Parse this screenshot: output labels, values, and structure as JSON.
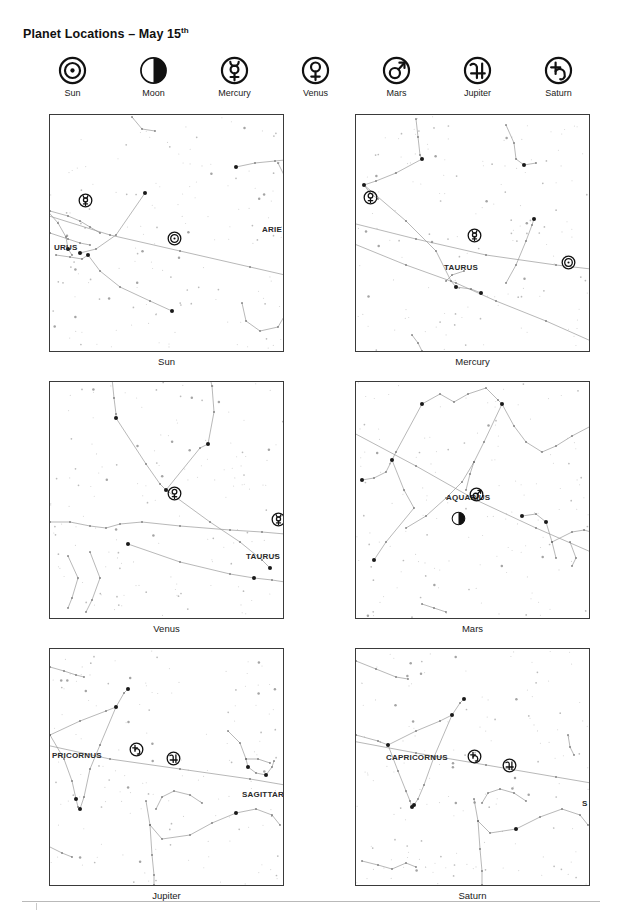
{
  "title": {
    "main": "Planet Locations – May 15",
    "ordinal": "th"
  },
  "legend": {
    "items": [
      {
        "label": "Sun",
        "icon": "sun-symbol-icon"
      },
      {
        "label": "Moon",
        "icon": "moon-phase-icon"
      },
      {
        "label": "Mercury",
        "icon": "mercury-symbol-icon"
      },
      {
        "label": "Venus",
        "icon": "venus-symbol-icon"
      },
      {
        "label": "Mars",
        "icon": "mars-symbol-icon"
      },
      {
        "label": "Jupiter",
        "icon": "jupiter-symbol-icon"
      },
      {
        "label": "Saturn",
        "icon": "saturn-symbol-icon"
      }
    ]
  },
  "panels": [
    {
      "caption": "Sun",
      "constellations": [
        {
          "text": "URUS",
          "x": 4,
          "y": 128
        },
        {
          "text": "ARIE",
          "x": 212,
          "y": 110
        }
      ],
      "markers": [
        {
          "body": "Mercury",
          "icon": "mercury-symbol-icon",
          "x": 35,
          "y": 86
        },
        {
          "body": "Sun",
          "icon": "sun-symbol-icon",
          "x": 124,
          "y": 124
        }
      ]
    },
    {
      "caption": "Mercury",
      "constellations": [
        {
          "text": "TAURUS",
          "x": 88,
          "y": 148
        }
      ],
      "markers": [
        {
          "body": "Venus",
          "icon": "venus-symbol-icon",
          "x": 14,
          "y": 83
        },
        {
          "body": "Mercury",
          "icon": "mercury-symbol-icon",
          "x": 118,
          "y": 121
        },
        {
          "body": "Sun",
          "icon": "sun-symbol-icon",
          "x": 212,
          "y": 148
        }
      ]
    },
    {
      "caption": "Venus",
      "constellations": [
        {
          "text": "TAURUS",
          "x": 196,
          "y": 170
        }
      ],
      "markers": [
        {
          "body": "Venus",
          "icon": "venus-symbol-icon",
          "x": 124,
          "y": 112
        },
        {
          "body": "Mercury",
          "icon": "mercury-symbol-icon",
          "x": 228,
          "y": 138
        }
      ]
    },
    {
      "caption": "Mars",
      "constellations": [
        {
          "text": "AQUARIUS",
          "x": 90,
          "y": 111
        }
      ],
      "markers": [
        {
          "body": "Mars",
          "icon": "mars-symbol-icon",
          "x": 120,
          "y": 113
        },
        {
          "body": "Moon",
          "icon": "moon-phase-icon",
          "x": 102,
          "y": 137
        }
      ]
    },
    {
      "caption": "Jupiter",
      "constellations": [
        {
          "text": "PRICORNUS",
          "x": 2,
          "y": 102
        },
        {
          "text": "SAGITTARI",
          "x": 192,
          "y": 141
        }
      ],
      "markers": [
        {
          "body": "Saturn",
          "icon": "saturn-symbol-icon",
          "x": 86,
          "y": 101
        },
        {
          "body": "Jupiter",
          "icon": "jupiter-symbol-icon",
          "x": 123,
          "y": 110
        }
      ]
    },
    {
      "caption": "Saturn",
      "constellations": [
        {
          "text": "CAPRICORNUS",
          "x": 30,
          "y": 104
        },
        {
          "text": "S",
          "x": 226,
          "y": 150
        }
      ],
      "markers": [
        {
          "body": "Saturn",
          "icon": "saturn-symbol-icon",
          "x": 118,
          "y": 108
        },
        {
          "body": "Jupiter",
          "icon": "jupiter-symbol-icon",
          "x": 153,
          "y": 117
        }
      ]
    }
  ],
  "colors": {
    "panel_border": "#3a3a3a",
    "star": "#8d8d8d",
    "bright_star": "#1a1a1a",
    "constellation_line": "#9a9a9a",
    "ecliptic_line": "#7d7d7d",
    "text": "#1a1a1a",
    "footer_rule": "#b9b9b9"
  }
}
